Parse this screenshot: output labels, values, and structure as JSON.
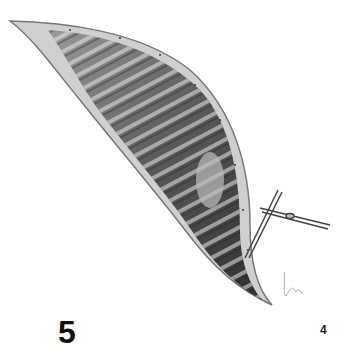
{
  "figure": {
    "number": "5",
    "page_number": "4",
    "instrument": "forceps-holding-needle",
    "signature": "artist-signature",
    "colors": {
      "background": "#ffffff",
      "muscle_dark": "#3a3a3a",
      "muscle_light": "#d8d8d8",
      "edge": "#8a8a8a"
    }
  }
}
